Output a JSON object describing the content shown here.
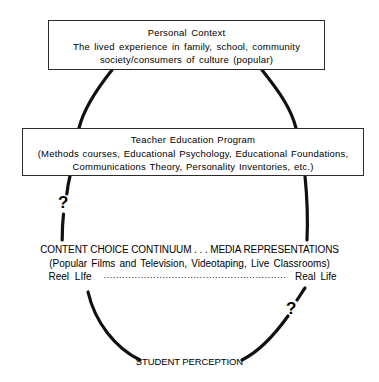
{
  "diagram": {
    "title_hidden": "",
    "boxes": [
      {
        "name": "personal-context",
        "lines": [
          "Personal  Context",
          "The  lived  experience  in  family,  school,  community",
          "society/consumers  of  culture  (popular)"
        ]
      },
      {
        "name": "teacher-education-program",
        "lines": [
          "Teacher Education Program",
          "(Methods courses, Educational Psychology, Educational Foundations,",
          "Communications Theory,  Personality  Inventories,  etc.)"
        ]
      }
    ],
    "content_continuum": {
      "title": "CONTENT CHOICE CONTINUUM . . . MEDIA REPRESENTATIONS",
      "subtitle": "(Popular  Films  and  Television,  Videotaping,  Live  Classrooms)",
      "left_pole": "Reel   LIfe",
      "leader": "...........................................................",
      "right_pole": "Real  Life"
    },
    "question_marks": {
      "left": "?",
      "right": "?"
    },
    "bottom_label": "STUDENT PERCEPTION",
    "colors": {
      "stroke": "#111111",
      "box_border": "#2b2b2b",
      "text": "#000000",
      "background": "#ffffff"
    }
  }
}
